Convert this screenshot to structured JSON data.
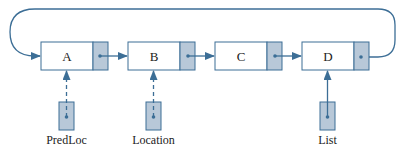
{
  "diagram": {
    "type": "circular-linked-list",
    "colors": {
      "line": "#3c6e96",
      "box_border": "#3c6e96",
      "pointer_fill": "#b8c8d8",
      "node_fill": "#ffffff",
      "text": "#222222"
    },
    "nodes": [
      {
        "label": "A"
      },
      {
        "label": "B"
      },
      {
        "label": "C"
      },
      {
        "label": "D"
      }
    ],
    "external_pointers": [
      {
        "label": "PredLoc",
        "points_to": "A",
        "style": "dashed"
      },
      {
        "label": "Location",
        "points_to": "B",
        "style": "dashed"
      },
      {
        "label": "List",
        "points_to": "D",
        "style": "solid"
      }
    ],
    "loop": {
      "from": "D",
      "to": "A"
    }
  }
}
